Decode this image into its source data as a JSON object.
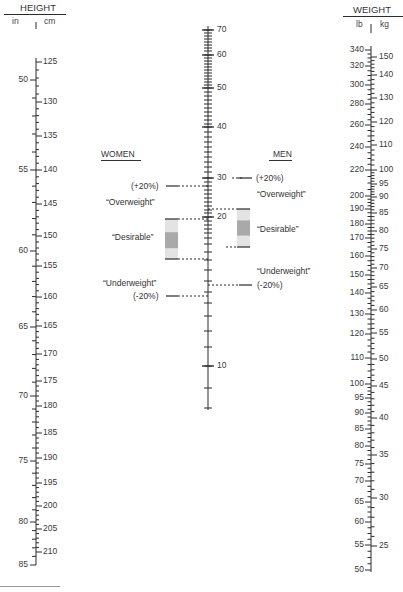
{
  "height_scale": {
    "title": "HEIGHT",
    "left_unit": "in",
    "right_unit": "cm",
    "axis_x": 36,
    "top_y": 62,
    "bottom_y": 565,
    "inches": [
      {
        "v": "50",
        "y": 80
      },
      {
        "v": "55",
        "y": 170
      },
      {
        "v": "60",
        "y": 251
      },
      {
        "v": "65",
        "y": 327
      },
      {
        "v": "70",
        "y": 396
      },
      {
        "v": "75",
        "y": 461
      },
      {
        "v": "80",
        "y": 522
      },
      {
        "v": "85",
        "y": 565
      }
    ],
    "cm": [
      {
        "v": "125",
        "y": 62
      },
      {
        "v": "130",
        "y": 102
      },
      {
        "v": "135",
        "y": 136
      },
      {
        "v": "140",
        "y": 170
      },
      {
        "v": "145",
        "y": 204
      },
      {
        "v": "150",
        "y": 236
      },
      {
        "v": "155",
        "y": 266
      },
      {
        "v": "160",
        "y": 297
      },
      {
        "v": "165",
        "y": 326
      },
      {
        "v": "170",
        "y": 354
      },
      {
        "v": "175",
        "y": 381
      },
      {
        "v": "180",
        "y": 406
      },
      {
        "v": "185",
        "y": 433
      },
      {
        "v": "190",
        "y": 458
      },
      {
        "v": "195",
        "y": 483
      },
      {
        "v": "200",
        "y": 506
      },
      {
        "v": "205",
        "y": 529
      },
      {
        "v": "210",
        "y": 552
      }
    ]
  },
  "bmi_scale": {
    "axis_x": 208,
    "top_y": 26,
    "bottom_y": 410,
    "labels": [
      {
        "v": "70",
        "y": 30
      },
      {
        "v": "60",
        "y": 55
      },
      {
        "v": "50",
        "y": 88
      },
      {
        "v": "40",
        "y": 127
      },
      {
        "v": "30",
        "y": 178
      },
      {
        "v": "20",
        "y": 217
      },
      {
        "v": "10",
        "y": 366
      }
    ],
    "minor_ticks": [
      30,
      33,
      36,
      39,
      42,
      45,
      48,
      51,
      55,
      58,
      61,
      64,
      67,
      70,
      73,
      76,
      79,
      82,
      85,
      88,
      92,
      96,
      100,
      104,
      108,
      112,
      116,
      120,
      124,
      127,
      132,
      137,
      142,
      147,
      152,
      157,
      162,
      167,
      172,
      178,
      182,
      186,
      190,
      194,
      198,
      202,
      206,
      210,
      213,
      217,
      221,
      225,
      229,
      233,
      238,
      244,
      252,
      260,
      270,
      281,
      292,
      303,
      316,
      331,
      347,
      366,
      388,
      408
    ]
  },
  "weight_scale": {
    "title": "WEIGHT",
    "left_unit": "lb",
    "right_unit": "kg",
    "axis_x": 371,
    "top_y": 46,
    "bottom_y": 572,
    "lb": [
      {
        "v": "340",
        "y": 50
      },
      {
        "v": "320",
        "y": 66
      },
      {
        "v": "300",
        "y": 85
      },
      {
        "v": "280",
        "y": 104
      },
      {
        "v": "260",
        "y": 125
      },
      {
        "v": "240",
        "y": 147
      },
      {
        "v": "220",
        "y": 170
      },
      {
        "v": "200",
        "y": 196
      },
      {
        "v": "190",
        "y": 209
      },
      {
        "v": "180",
        "y": 224
      },
      {
        "v": "170",
        "y": 238
      },
      {
        "v": "160",
        "y": 256
      },
      {
        "v": "150",
        "y": 275
      },
      {
        "v": "140",
        "y": 293
      },
      {
        "v": "130",
        "y": 314
      },
      {
        "v": "120",
        "y": 334
      },
      {
        "v": "110",
        "y": 358
      },
      {
        "v": "100",
        "y": 384
      },
      {
        "v": "95",
        "y": 398
      },
      {
        "v": "90",
        "y": 413
      },
      {
        "v": "85",
        "y": 429
      },
      {
        "v": "80",
        "y": 446
      },
      {
        "v": "75",
        "y": 464
      },
      {
        "v": "70",
        "y": 481
      },
      {
        "v": "65",
        "y": 502
      },
      {
        "v": "60",
        "y": 522
      },
      {
        "v": "55",
        "y": 545
      },
      {
        "v": "50",
        "y": 570
      }
    ],
    "kg": [
      {
        "v": "150",
        "y": 57
      },
      {
        "v": "140",
        "y": 75
      },
      {
        "v": "130",
        "y": 98
      },
      {
        "v": "120",
        "y": 122
      },
      {
        "v": "110",
        "y": 145
      },
      {
        "v": "100",
        "y": 170
      },
      {
        "v": "95",
        "y": 184
      },
      {
        "v": "90",
        "y": 197
      },
      {
        "v": "85",
        "y": 213
      },
      {
        "v": "80",
        "y": 231
      },
      {
        "v": "75",
        "y": 249
      },
      {
        "v": "70",
        "y": 268
      },
      {
        "v": "65",
        "y": 287
      },
      {
        "v": "60",
        "y": 310
      },
      {
        "v": "55",
        "y": 333
      },
      {
        "v": "50",
        "y": 359
      },
      {
        "v": "45",
        "y": 386
      },
      {
        "v": "40",
        "y": 418
      },
      {
        "v": "35",
        "y": 455
      },
      {
        "v": "30",
        "y": 498
      },
      {
        "v": "25",
        "y": 546
      }
    ]
  },
  "women": {
    "title": "WOMEN",
    "overweight_pct": "(+20%)",
    "overweight_label": "“Overweight”",
    "desirable_label": "“Desirable”",
    "underweight_label": "“Underweight”",
    "underweight_pct": "(-20%)",
    "overweight_y": 186,
    "desirable_top_y": 219,
    "desirable_bottom_y": 259,
    "underweight_y": 296
  },
  "men": {
    "title": "MEN",
    "overweight_pct": "(+20%)",
    "overweight_label": "“Overweight”",
    "desirable_label": "“Desirable”",
    "underweight_label": "“Underweight”",
    "underweight_pct": "(-20%)",
    "overweight_y": 178,
    "desirable_top_y": 209,
    "desirable_bottom_y": 247,
    "underweight_y": 285
  },
  "colors": {
    "line": "#2b2b2b",
    "box_light": "#e3e3e3",
    "box_dark": "#a9a9a9"
  }
}
